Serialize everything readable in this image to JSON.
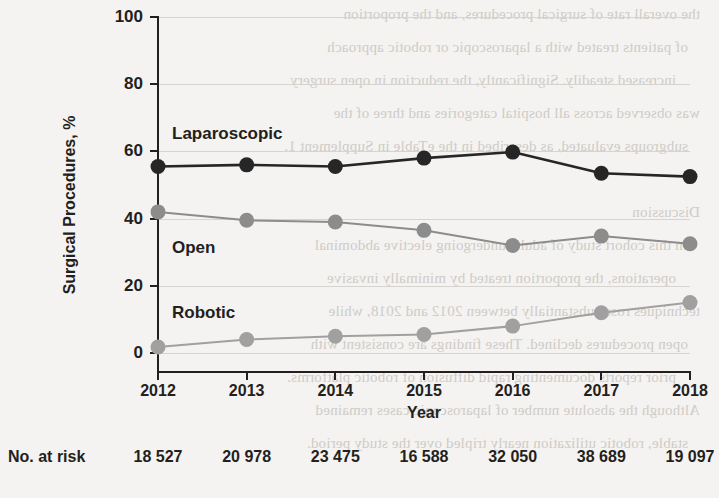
{
  "chart_data": {
    "type": "line",
    "title": "",
    "xlabel": "Year",
    "ylabel": "Surgical Procedures, %",
    "categories": [
      "2012",
      "2013",
      "2014",
      "2015",
      "2016",
      "2017",
      "2018"
    ],
    "x": [
      2012,
      2013,
      2014,
      2015,
      2016,
      2017,
      2018
    ],
    "xlim": [
      2012,
      2018
    ],
    "ylim": [
      0,
      100
    ],
    "yticks": [
      0,
      20,
      40,
      60,
      80,
      100
    ],
    "ytick_labels": [
      "0",
      "20",
      "40",
      "60",
      "80",
      "100"
    ],
    "grid": "horizontal",
    "legend_position": "inline-annotations",
    "series": [
      {
        "name": "Laparoscopic",
        "color": "#262626",
        "values": [
          55.5,
          56.0,
          55.5,
          58.0,
          59.8,
          53.5,
          52.5
        ]
      },
      {
        "name": "Open",
        "color": "#8c8c8c",
        "values": [
          42.0,
          39.5,
          39.0,
          36.5,
          32.0,
          34.8,
          32.5
        ]
      },
      {
        "name": "Robotic",
        "color": "#a0a0a0",
        "values": [
          1.8,
          4.0,
          5.0,
          5.5,
          8.0,
          12.0,
          15.0
        ]
      }
    ],
    "annotations": [
      {
        "text": "Laparoscopic",
        "x": 2012,
        "y": 65.5
      },
      {
        "text": "Open",
        "x": 2012,
        "y": 31.5
      },
      {
        "text": "Robotic",
        "x": 2012,
        "y": 13.5
      }
    ]
  },
  "at_risk": {
    "label": "No. at risk",
    "values": [
      "18 527",
      "20 978",
      "23 475",
      "16 588",
      "32 050",
      "38 689",
      "19 097"
    ]
  },
  "bleed_text": [
    "the overall rate of surgical procedures, and the proportion",
    "of patients treated with a laparoscopic or robotic approach",
    "increased steadily. Significantly, the reduction in open surgery",
    "was observed across all hospital categories and three of the",
    "subgroups evaluated, as described in the eTable in Supplement 1.",
    "",
    "Discussion",
    "In this cohort study of adults undergoing elective abdominal",
    "operations, the proportion treated by minimally invasive",
    "techniques rose substantially between 2012 and 2018, while",
    "open procedures declined. These findings are consistent with",
    "prior reports documenting rapid diffusion of robotic platforms.",
    "Although the absolute number of laparoscopic cases remained",
    "stable, robotic utilization nearly tripled over the study period."
  ]
}
